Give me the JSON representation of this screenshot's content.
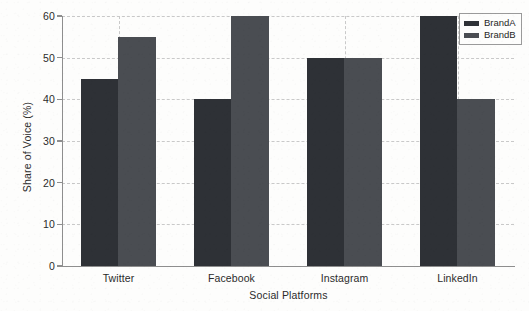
{
  "chart_data": {
    "type": "bar",
    "title": "",
    "subtitle": "",
    "xlabel": "Social Platforms",
    "ylabel": "Share of Voice (%)",
    "categories": [
      "Twitter",
      "Facebook",
      "Instagram",
      "LinkedIn"
    ],
    "series": [
      {
        "name": "BrandA",
        "values": [
          45,
          40,
          50,
          60
        ],
        "color": "#2e3136"
      },
      {
        "name": "BrandB",
        "values": [
          55,
          60,
          50,
          40
        ],
        "color": "#4a4d52"
      }
    ],
    "ylim": [
      0,
      60
    ],
    "ytick_values": [
      0,
      10,
      20,
      30,
      40,
      50,
      60
    ],
    "ytick_labels": [
      "0",
      "10",
      "20",
      "30",
      "40",
      "50",
      "60"
    ],
    "grid": true,
    "grid_axis": "both",
    "grid_style": "dashed",
    "grid_color": "#c9c9c9",
    "legend_position": "upper right",
    "legend_entries": [
      "BrandA",
      "BrandB"
    ],
    "background_color": "#fdfdfc",
    "axis_color": "#8e8e8e",
    "annotations": []
  }
}
